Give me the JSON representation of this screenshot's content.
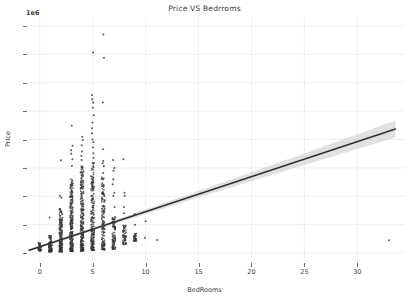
{
  "chart_data": {
    "type": "scatter",
    "title": "Price VS Bedrroms",
    "xlabel": "BedRooms",
    "ylabel": "Price",
    "y_offset_text": "1e6",
    "y_offset_multiplier": 1000000,
    "xlim": [
      -1.2,
      34.5
    ],
    "ylim": [
      -0.35,
      8.35
    ],
    "grid": true,
    "legend": null,
    "xticks": [
      0,
      5,
      10,
      15,
      20,
      25,
      30
    ],
    "yticks": [
      0,
      1,
      2,
      3,
      4,
      5,
      6,
      7,
      8
    ],
    "xtick_labels": [
      "0",
      "5",
      "10",
      "15",
      "20",
      "25",
      "30"
    ],
    "ytick_labels": [
      "0",
      "1",
      "2",
      "3",
      "4",
      "5",
      "6",
      "7",
      "8"
    ],
    "marker_color": "#3a3a3a",
    "line_color": "#2f2f2f",
    "band_color": "#c8c8c8",
    "grid_color": "#e9e9e9",
    "regression": {
      "intercept": 0.22,
      "slope": 0.1235,
      "x_start": -1.0,
      "x_end": 33.6,
      "band_half_width_start": 0.05,
      "band_half_width_end": 0.3
    },
    "series": [
      {
        "name": "Price vs BedRooms",
        "description": "Dense vertical columns of observations at each integer bedroom count; values in units of 1e6.",
        "columns": [
          {
            "x": 0,
            "y_min": 0.08,
            "y_max": 0.38,
            "density": 16,
            "n": 12
          },
          {
            "x": 1,
            "y_min": 0.05,
            "y_max": 0.62,
            "density": 34,
            "n": 180
          },
          {
            "x": 1,
            "y_outliers": [
              1.25
            ]
          },
          {
            "x": 2,
            "y_min": 0.05,
            "y_max": 1.58,
            "density": 62,
            "n": 2700
          },
          {
            "x": 2,
            "y_outliers": [
              1.95,
              2.02,
              3.27
            ]
          },
          {
            "x": 3,
            "y_min": 0.06,
            "y_max": 2.62,
            "density": 78,
            "n": 9800
          },
          {
            "x": 3,
            "y_outliers": [
              3.07,
              3.3,
              3.5,
              3.62,
              3.78,
              4.48
            ]
          },
          {
            "x": 4,
            "y_min": 0.08,
            "y_max": 3.08,
            "density": 86,
            "n": 6880
          },
          {
            "x": 4,
            "y_outliers": [
              3.28,
              3.42,
              3.58,
              3.8,
              3.98,
              4.1
            ]
          },
          {
            "x": 5,
            "y_min": 0.1,
            "y_max": 3.2,
            "density": 74,
            "n": 1600
          },
          {
            "x": 5,
            "y_outliers": [
              3.35,
              3.52,
              3.72,
              3.9,
              4.0,
              4.22,
              4.4,
              4.6,
              4.85,
              5.12,
              5.3,
              5.42,
              5.57,
              7.06
            ]
          },
          {
            "x": 6,
            "y_min": 0.12,
            "y_max": 2.7,
            "density": 52,
            "n": 270
          },
          {
            "x": 6,
            "y_outliers": [
              2.82,
              3.06,
              3.16,
              3.24,
              3.66,
              5.3,
              6.88,
              7.7
            ]
          },
          {
            "x": 7,
            "y_min": 0.14,
            "y_max": 1.3,
            "density": 34,
            "n": 38
          },
          {
            "x": 7,
            "y_outliers": [
              1.62,
              2.02,
              2.12,
              2.42,
              2.6,
              2.9,
              3.0,
              3.28
            ]
          },
          {
            "x": 8,
            "y_min": 0.3,
            "y_max": 1.02,
            "density": 20,
            "n": 13
          },
          {
            "x": 8,
            "y_outliers": [
              1.4,
              1.62,
              2.02,
              2.12,
              3.3
            ]
          },
          {
            "x": 9,
            "y_min": 0.42,
            "y_max": 0.7,
            "density": 12,
            "n": 6
          },
          {
            "x": 9,
            "y_outliers": [
              1.0,
              1.38
            ]
          },
          {
            "x": 10,
            "y_outliers": [
              0.54,
              1.12
            ]
          },
          {
            "x": 11,
            "y_outliers": [
              0.46
            ]
          },
          {
            "x": 33,
            "y_outliers": [
              0.45
            ]
          }
        ],
        "notes": "Single far-right observation at 33 bedrooms with price 0.45e6 stretches the x-axis and drives the regression slope."
      }
    ]
  }
}
